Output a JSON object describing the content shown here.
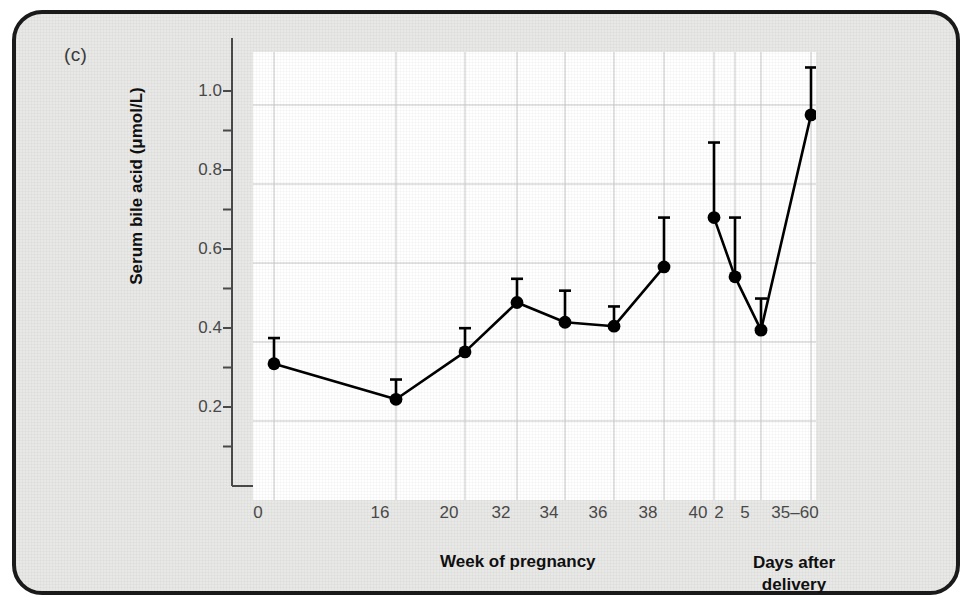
{
  "figure": {
    "panel_label": "(c)"
  },
  "chart_data": {
    "type": "line",
    "title": "",
    "xlabel": "Week of pregnancy",
    "xlabel_secondary": "Days after delivery",
    "xlabel_secondary_line1": "Days after",
    "xlabel_secondary_line2": "delivery",
    "ylabel": "Serum bile acid (μmol/L)",
    "ylim": [
      0.0,
      1.1
    ],
    "ytick_labels": [
      "0.2",
      "0.4",
      "0.6",
      "0.8",
      "1.0"
    ],
    "ytick_values": [
      0.2,
      0.4,
      0.6,
      0.8,
      1.0
    ],
    "yminor_values": [
      0.1,
      0.3,
      0.5,
      0.7,
      0.9
    ],
    "grid": true,
    "axis_breaks": [
      "between 0 and 16",
      "between 40 and 2"
    ],
    "categories": [
      "0",
      "16",
      "20",
      "32",
      "34",
      "36",
      "38",
      "40",
      "2",
      "5",
      "35–60"
    ],
    "xtick_labels": [
      "0",
      "16",
      "20",
      "32",
      "34",
      "36",
      "38",
      "40",
      "2",
      "5",
      "35–60"
    ],
    "series": [
      {
        "name": "Serum bile acid",
        "marker": "filled-circle",
        "errorbar": "upper only",
        "points": [
          {
            "x_label": "0",
            "y": 0.345,
            "yerr_upper": 0.41,
            "connected_to_next": false
          },
          {
            "x_label": "16",
            "y": 0.255,
            "yerr_upper": 0.305,
            "connected_to_next": true
          },
          {
            "x_label": "20",
            "y": 0.375,
            "yerr_upper": 0.435,
            "connected_to_next": true
          },
          {
            "x_label": "32",
            "y": 0.5,
            "yerr_upper": 0.56,
            "connected_to_next": true
          },
          {
            "x_label": "34",
            "y": 0.45,
            "yerr_upper": 0.53,
            "connected_to_next": true
          },
          {
            "x_label": "36",
            "y": 0.44,
            "yerr_upper": 0.49,
            "connected_to_next": true
          },
          {
            "x_label": "38",
            "y": 0.59,
            "yerr_upper": 0.715,
            "connected_to_next": true
          },
          {
            "x_label": "40",
            "y": 0.715,
            "yerr_upper": 0.905,
            "connected_to_next": false
          },
          {
            "x_label": "2",
            "y": 0.565,
            "yerr_upper": 0.715,
            "connected_to_next": true
          },
          {
            "x_label": "5",
            "y": 0.43,
            "yerr_upper": 0.51,
            "connected_to_next": true
          },
          {
            "x_label": "35–60",
            "y": 0.975,
            "yerr_upper": 1.095,
            "connected_to_next": false
          }
        ]
      }
    ]
  },
  "colors": {
    "frame": "#1a1a1a",
    "background": "#e8e8e6",
    "plot_background": "#ffffff",
    "data": "#000000",
    "grid": "#c9c9c9",
    "axis": "#4a4a4a",
    "tick_text": "#4a4a4a"
  }
}
